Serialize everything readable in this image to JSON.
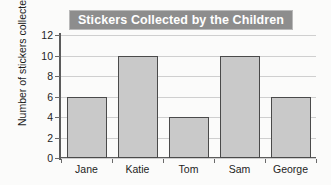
{
  "chart_data": {
    "type": "bar",
    "title": "Stickers Collected by the Children",
    "xlabel": "",
    "ylabel": "Number of stickers collected",
    "categories": [
      "Jane",
      "Katie",
      "Tom",
      "Sam",
      "George"
    ],
    "values": [
      6,
      10,
      4,
      10,
      6
    ],
    "ylim": [
      0,
      12
    ],
    "ytick_labels": [
      "0",
      "2",
      "4",
      "6",
      "8",
      "10",
      "12"
    ],
    "ytick_values": [
      0,
      2,
      4,
      6,
      8,
      10,
      12
    ],
    "grid": true,
    "legend": false,
    "colors": {
      "bar_fill": "#c9c9c9",
      "bar_edge": "#4a4a4a",
      "title_banner": "#8d8d8d",
      "title_text": "#ffffff",
      "gridline": "#cfcfcf",
      "axis": "#5b5b5b",
      "background": "#fbfbfa",
      "text": "#1d1d1d"
    }
  }
}
